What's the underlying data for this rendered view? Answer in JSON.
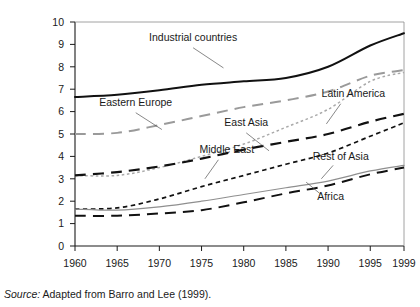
{
  "source_note": {
    "prefix": "Source:",
    "text": " Adapted from Barro and Lee (1999)."
  },
  "chart_data": {
    "type": "line",
    "title": "",
    "subtitle": "",
    "xlabel": "",
    "ylabel": "",
    "grid": false,
    "legend_position": "inline-annotations",
    "x": [
      1960,
      1965,
      1970,
      1975,
      1980,
      1985,
      1990,
      1995,
      1999
    ],
    "xticklabels": [
      "1960",
      "1965",
      "1970",
      "1975",
      "1980",
      "1985",
      "1990",
      "1995",
      "1999"
    ],
    "xlim": [
      1960,
      1999
    ],
    "ylim": [
      0,
      10
    ],
    "yticks": [
      0,
      1,
      2,
      3,
      4,
      5,
      6,
      7,
      8,
      9,
      10
    ],
    "yticklabels": [
      "0",
      "1",
      "2",
      "3",
      "4",
      "5",
      "6",
      "7",
      "8",
      "9",
      "10"
    ],
    "series": [
      {
        "name": "Industrial countries",
        "values": [
          6.65,
          6.75,
          6.95,
          7.2,
          7.35,
          7.5,
          8.0,
          8.95,
          9.5
        ],
        "color": "#111111",
        "style": "solid",
        "width": 2.0,
        "label_x": 1974.0,
        "label_y": 9.15,
        "anchor": "middle",
        "leader": [
          [
            1974.0,
            8.85
          ],
          [
            1977.6,
            7.95
          ]
        ]
      },
      {
        "name": "Eastern Europe",
        "values": [
          5.0,
          5.05,
          5.4,
          5.8,
          6.2,
          6.5,
          6.9,
          7.6,
          7.85
        ],
        "color": "#9a9a9a",
        "style": "long-dash",
        "width": 2.0,
        "label_x": 1967.2,
        "label_y": 6.25,
        "anchor": "middle",
        "leader": [
          [
            1967.2,
            5.95
          ],
          [
            1970.3,
            5.2
          ]
        ]
      },
      {
        "name": "East Asia",
        "values": [
          3.15,
          3.15,
          3.5,
          4.0,
          4.55,
          5.3,
          6.1,
          7.35,
          7.75
        ],
        "color": "#a9a9a9",
        "style": "dotted",
        "width": 1.5,
        "label_x": 1980.3,
        "label_y": 5.35,
        "anchor": "middle",
        "leader": [
          [
            1980.3,
            5.05
          ],
          [
            1983.0,
            4.25
          ]
        ]
      },
      {
        "name": "Latin America",
        "values": [
          3.15,
          3.3,
          3.55,
          3.9,
          4.3,
          4.65,
          5.0,
          5.55,
          5.9
        ],
        "color": "#111111",
        "style": "long-dash",
        "width": 2.2,
        "label_x": 1993.0,
        "label_y": 6.65,
        "anchor": "middle",
        "leader": [
          [
            1991.5,
            6.35
          ],
          [
            1989.8,
            5.45
          ]
        ]
      },
      {
        "name": "Middle East",
        "values": [
          1.65,
          1.7,
          2.1,
          2.65,
          3.15,
          3.65,
          4.15,
          4.9,
          5.5
        ],
        "color": "#111111",
        "style": "short-dash",
        "width": 1.7,
        "label_x": 1978.0,
        "label_y": 4.15,
        "anchor": "middle",
        "leader": [
          [
            1977.0,
            3.85
          ],
          [
            1975.4,
            3.0
          ]
        ]
      },
      {
        "name": "Rest of Asia",
        "values": [
          1.65,
          1.6,
          1.75,
          2.0,
          2.3,
          2.6,
          2.9,
          3.35,
          3.6
        ],
        "color": "#8f8f8f",
        "style": "solid",
        "width": 1.2,
        "label_x": 1991.5,
        "label_y": 3.85,
        "anchor": "middle",
        "leader": [
          [
            1990.6,
            3.6
          ],
          [
            1989.2,
            3.0
          ]
        ]
      },
      {
        "name": "Africa",
        "values": [
          1.35,
          1.35,
          1.45,
          1.6,
          1.95,
          2.35,
          2.7,
          3.2,
          3.5
        ],
        "color": "#111111",
        "style": "long-dash",
        "width": 2.0,
        "label_x": 1990.3,
        "label_y": 2.05,
        "anchor": "middle",
        "leader": [
          [
            1989.0,
            2.35
          ],
          [
            1987.4,
            2.85
          ]
        ]
      }
    ]
  }
}
